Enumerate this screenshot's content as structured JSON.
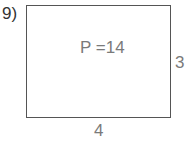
{
  "problem": {
    "number_label": "9)"
  },
  "figure": {
    "shape": "rectangle",
    "perimeter_label": "P =14",
    "side_right_label": "3",
    "side_bottom_label": "4"
  }
}
